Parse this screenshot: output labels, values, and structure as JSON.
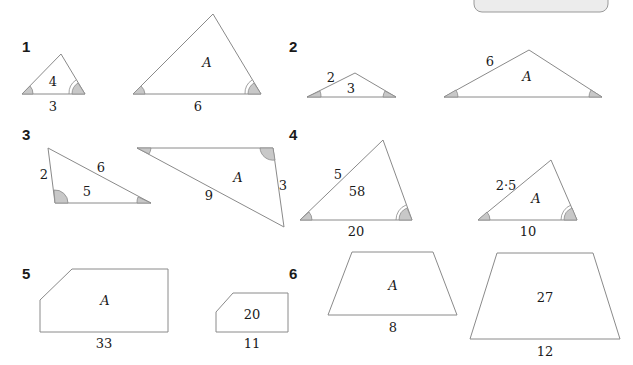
{
  "page": {
    "type": "similar-figures-exercise",
    "tab_label": ""
  },
  "questions": [
    {
      "number": "1",
      "figures": [
        {
          "kind": "triangle",
          "inside": "4",
          "base": "3",
          "sides": {}
        },
        {
          "kind": "triangle",
          "inside": "A",
          "base": "6",
          "sides": {}
        }
      ]
    },
    {
      "number": "2",
      "figures": [
        {
          "kind": "triangle",
          "inside": "3",
          "base": "",
          "sides": {
            "left": "2"
          }
        },
        {
          "kind": "triangle",
          "inside": "A",
          "base": "",
          "sides": {
            "left": "6"
          }
        }
      ]
    },
    {
      "number": "3",
      "figures": [
        {
          "kind": "triangle",
          "inside": "5",
          "base": "",
          "sides": {
            "left": "2",
            "hyp": "6"
          }
        },
        {
          "kind": "triangle",
          "inside": "A",
          "base": "",
          "sides": {
            "right": "3",
            "hyp": "9"
          }
        }
      ]
    },
    {
      "number": "4",
      "figures": [
        {
          "kind": "triangle",
          "inside": "58",
          "base": "20",
          "sides": {
            "left": "5"
          }
        },
        {
          "kind": "triangle",
          "inside": "A",
          "base": "10",
          "sides": {
            "left": "2·5"
          }
        }
      ]
    },
    {
      "number": "5",
      "figures": [
        {
          "kind": "pentagon",
          "inside": "A",
          "base": "33"
        },
        {
          "kind": "pentagon",
          "inside": "20",
          "base": "11"
        }
      ]
    },
    {
      "number": "6",
      "figures": [
        {
          "kind": "trapezium",
          "inside": "A",
          "base": "8"
        },
        {
          "kind": "trapezium",
          "inside": "27",
          "base": "12"
        }
      ]
    }
  ],
  "colors": {
    "outline": "#8a8a8a",
    "angle_fill": "#c8c8c8",
    "text": "#1a1a1a"
  }
}
